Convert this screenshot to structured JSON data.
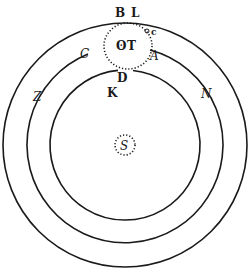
{
  "figure": {
    "labels": {
      "B": "B",
      "L": "L",
      "c": "c",
      "C": "C",
      "A": "A",
      "earth_symbol": "ʘ",
      "T": "T",
      "D": "D",
      "K": "K",
      "Z": "Z",
      "N": "N",
      "S": "S"
    },
    "colors": {
      "ink": "#1a1a1a",
      "paper": "#ffffff"
    },
    "geometry": {
      "center": [
        125,
        145
      ],
      "orbit_radii": [
        122,
        98,
        75
      ],
      "earth_sphere": {
        "cx": 128,
        "cy": 46,
        "rx": 24,
        "ry": 23
      },
      "sun_circle": {
        "cx": 125,
        "cy": 145,
        "r": 10
      }
    }
  }
}
